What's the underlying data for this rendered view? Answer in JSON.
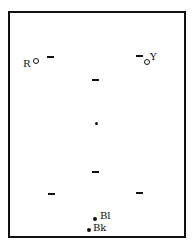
{
  "diagram": {
    "type": "pool-table-layout",
    "border_color": "#111111",
    "balls": [
      {
        "id": "red",
        "label": "R",
        "style": "ring",
        "x": 35,
        "y": 61
      },
      {
        "id": "yellow",
        "label": "Y",
        "style": "ring",
        "x": 147,
        "y": 62
      },
      {
        "id": "center",
        "label": "",
        "style": "dot",
        "x": 96,
        "y": 124
      },
      {
        "id": "blue",
        "label": "Bl",
        "style": "dot",
        "x": 95,
        "y": 219
      },
      {
        "id": "black",
        "label": "Bk",
        "style": "dot",
        "x": 89,
        "y": 230
      }
    ],
    "markers": [
      {
        "x": 50,
        "y": 57
      },
      {
        "x": 139,
        "y": 56
      },
      {
        "x": 95,
        "y": 80
      },
      {
        "x": 95,
        "y": 172
      },
      {
        "x": 51,
        "y": 194
      },
      {
        "x": 139,
        "y": 193
      }
    ]
  }
}
